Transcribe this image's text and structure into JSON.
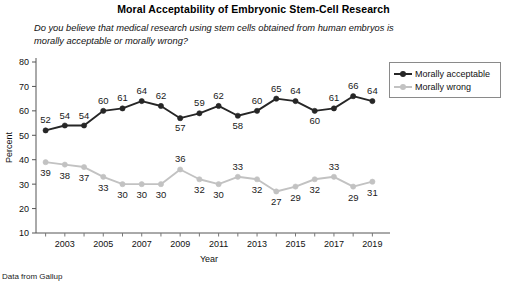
{
  "chart_data": {
    "type": "line",
    "title": "Moral Acceptability of Embryonic Stem-Cell Research",
    "subtitle": "Do you believe that medical research using stem cells obtained from human embryos is morally acceptable or morally wrong?",
    "xlabel": "Year",
    "ylabel": "Percent",
    "ylim": [
      10,
      80
    ],
    "ytick_step": 10,
    "yticks": [
      10,
      20,
      30,
      40,
      50,
      60,
      70,
      80
    ],
    "xlim": [
      2001.5,
      2019.5
    ],
    "xticks_major": [
      2003,
      2005,
      2007,
      2009,
      2011,
      2013,
      2015,
      2017,
      2019
    ],
    "xticks_minor": [
      2002,
      2004,
      2006,
      2008,
      2010,
      2012,
      2014,
      2016,
      2018
    ],
    "grid": false,
    "legend_position": "upper right outside",
    "x": [
      2002,
      2003,
      2004,
      2005,
      2006,
      2007,
      2008,
      2009,
      2010,
      2011,
      2012,
      2013,
      2014,
      2015,
      2016,
      2017,
      2018,
      2019
    ],
    "series": [
      {
        "name": "Morally acceptable",
        "color": "#262626",
        "values": [
          52,
          54,
          54,
          60,
          61,
          64,
          62,
          57,
          59,
          62,
          58,
          60,
          65,
          64,
          60,
          61,
          66,
          64
        ]
      },
      {
        "name": "Morally wrong",
        "color": "#c2c2c2",
        "values": [
          39,
          38,
          37,
          33,
          30,
          30,
          30,
          36,
          32,
          30,
          33,
          32,
          27,
          29,
          32,
          33,
          29,
          31
        ]
      }
    ],
    "source_note": "Data from Gallup"
  },
  "legend": {
    "items": [
      {
        "label": "Morally acceptable"
      },
      {
        "label": "Morally wrong"
      }
    ]
  }
}
